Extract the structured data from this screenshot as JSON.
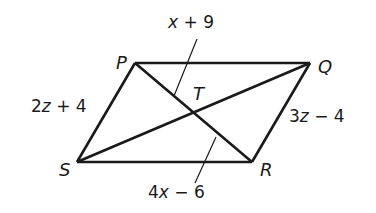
{
  "diagram": {
    "type": "parallelogram-with-diagonals",
    "colors": {
      "stroke": "#1a1a1a",
      "background": "#ffffff"
    },
    "vertices": {
      "P": {
        "label": "P",
        "x": 135,
        "y": 63
      },
      "Q": {
        "label": "Q",
        "x": 310,
        "y": 63
      },
      "R": {
        "label": "R",
        "x": 252,
        "y": 162
      },
      "S": {
        "label": "S",
        "x": 77,
        "y": 162
      },
      "T": {
        "label": "T",
        "x": 193,
        "y": 112
      }
    },
    "side_labels": {
      "PS": {
        "coef": "2",
        "var": "z",
        "op": " + ",
        "const": "4"
      },
      "QR": {
        "coef": "3",
        "var": "z",
        "op": " − ",
        "const": "4"
      }
    },
    "segment_labels": {
      "PT": {
        "coef": "",
        "var": "x",
        "op": " + ",
        "const": "9"
      },
      "TR": {
        "coef": "4",
        "var": "x",
        "op": " − ",
        "const": "6"
      }
    }
  }
}
